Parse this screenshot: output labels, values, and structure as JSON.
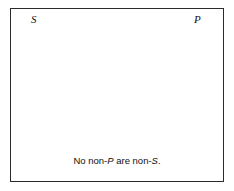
{
  "diagram": {
    "type": "venn-two-circle",
    "title_text": "",
    "caption": {
      "full_text": "No non-P are non-S.",
      "segments": [
        {
          "text": "No non-",
          "style": "roman"
        },
        {
          "text": "P",
          "style": "italic"
        },
        {
          "text": " are non-",
          "style": "roman"
        },
        {
          "text": "S",
          "style": "italic"
        },
        {
          "text": ".",
          "style": "roman"
        }
      ]
    },
    "labels": {
      "left_circle": "S",
      "right_circle": "P"
    },
    "colors": {
      "background": "#ffffff",
      "frame_stroke": "#2b2b2b",
      "circle_stroke": "#111111",
      "hatch_stroke": "#1a1a1a",
      "text": "#111111"
    },
    "frame": {
      "x": 10,
      "y": 8,
      "width": 214,
      "height": 174,
      "stroke_width": 1
    },
    "circles": [
      {
        "name": "S",
        "cx": 86,
        "cy": 85.5,
        "r": 62,
        "stroke_width": 1.6
      },
      {
        "name": "P",
        "cx": 142,
        "cy": 85.5,
        "r": 62,
        "stroke_width": 1.6
      }
    ],
    "shading": {
      "region": "outside-both-circles",
      "pattern": "horizontal-lines",
      "line_spacing_px": 2.3,
      "line_width_px": 0.9,
      "band_top": 28,
      "band_bottom": 146,
      "band_left": 11,
      "band_right": 223,
      "meaning": "shaded area is empty"
    }
  }
}
